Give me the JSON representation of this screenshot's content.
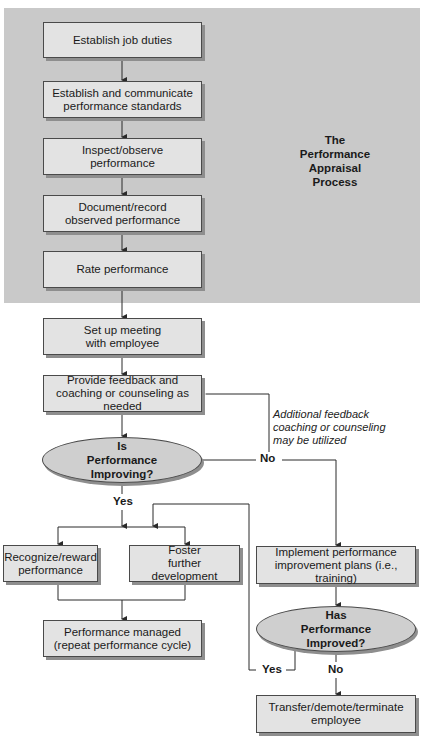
{
  "caption": "Typical Flowchart of the Performance Appraisal Process",
  "panel": {
    "title_lines": [
      "The",
      "Performance",
      "Appraisal",
      "Process"
    ],
    "background_color": "#c9c9c9"
  },
  "steps": {
    "establish_duties": "Establish job duties",
    "establish_standards": "Establish and communicate performance standards",
    "inspect": "Inspect/observe performance",
    "document": "Document/record observed performance",
    "rate": "Rate performance",
    "meeting": "Set up meeting with employee",
    "feedback": "Provide feedback and coaching or counseling as needed",
    "recognize": "Recognize/reward performance",
    "foster": "Foster further development",
    "managed": "Performance managed (repeat performance cycle)",
    "implement": "Implement performance improvement plans (i.e., training)",
    "transfer": "Transfer/demote/terminate employee"
  },
  "decisions": {
    "improving": "Is Performance Improving?",
    "improved": "Has Performance Improved?"
  },
  "labels": {
    "improving_yes": "Yes",
    "improving_no": "No",
    "improved_yes": "Yes",
    "improved_no": "No"
  },
  "note": "Additional feedback coaching or counseling may be utilized",
  "colors": {
    "box_fill": "#e3e3e3",
    "ellipse_fill": "#cfcfcf",
    "line": "#2a2a2a"
  }
}
